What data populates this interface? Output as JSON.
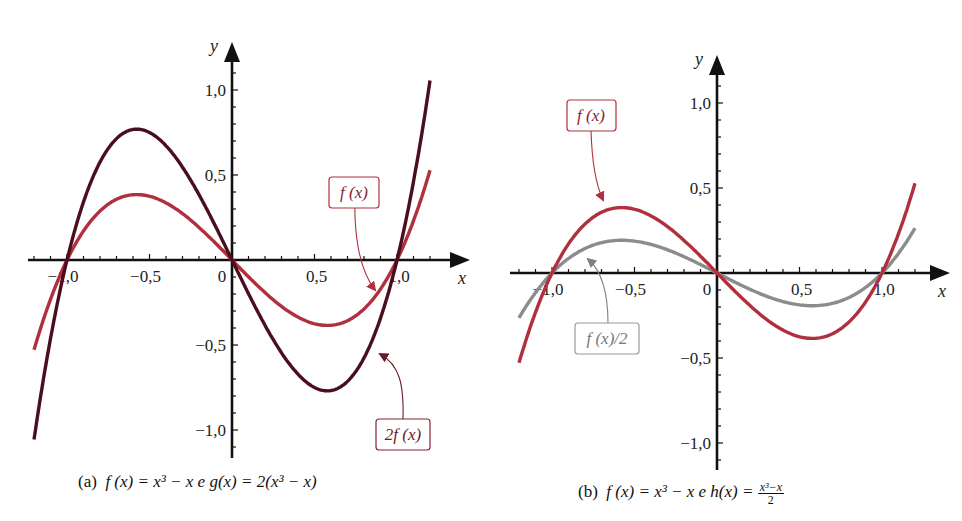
{
  "panels": [
    {
      "id": "a",
      "caption": {
        "prefix": "(a)",
        "text": "f (x) = x³ − x  e  g(x) = 2(x³ − x)"
      },
      "axes": {
        "x_label": "x",
        "y_label": "y",
        "x_ticks": [
          "−1,0",
          "−0,5",
          "0",
          "0,5",
          "1,0"
        ],
        "y_ticks": [
          "1,0",
          "0,5",
          "−0,5",
          "−1,0"
        ]
      },
      "annotations": [
        {
          "label": "f (x)",
          "color": "#b0303f"
        },
        {
          "label": "2f (x)",
          "color": "#6a1a2a"
        }
      ]
    },
    {
      "id": "b",
      "caption": {
        "prefix": "(b)",
        "text": "f (x) = x³ − x  e  h(x) = ",
        "frac_num": "x³−x",
        "frac_den": "2"
      },
      "axes": {
        "x_label": "x",
        "y_label": "y",
        "x_ticks": [
          "−1,0",
          "−0,5",
          "0",
          "0,5",
          "1,0"
        ],
        "y_ticks": [
          "1,0",
          "0,5",
          "−0,5",
          "−1,0"
        ]
      },
      "annotations": [
        {
          "label": "f (x)",
          "color": "#b0303f"
        },
        {
          "label": "f (x)/2",
          "color": "#888888"
        }
      ]
    }
  ],
  "chart_data": [
    {
      "type": "line",
      "title": "(a) f(x) = x^3 − x e g(x) = 2(x^3 − x)",
      "xlabel": "x",
      "ylabel": "y",
      "xlim": [
        -1.2,
        1.2
      ],
      "ylim": [
        -1.1,
        1.1
      ],
      "x_ticks": [
        -1.0,
        -0.5,
        0,
        0.5,
        1.0
      ],
      "y_ticks": [
        -1.0,
        -0.5,
        0.5,
        1.0
      ],
      "grid": false,
      "x": [
        -1.2,
        -1.0,
        -0.8,
        -0.577,
        -0.4,
        -0.2,
        0,
        0.2,
        0.4,
        0.577,
        0.8,
        1.0,
        1.2
      ],
      "series": [
        {
          "name": "f(x)",
          "color": "#b0303f",
          "values": [
            -0.528,
            0,
            0.288,
            0.385,
            0.336,
            0.192,
            0,
            -0.192,
            -0.336,
            -0.385,
            -0.288,
            0,
            0.528
          ]
        },
        {
          "name": "2f(x)",
          "color": "#4a0f1e",
          "values": [
            -1.056,
            0,
            0.576,
            0.77,
            0.672,
            0.384,
            0,
            -0.384,
            -0.672,
            -0.77,
            -0.576,
            0,
            1.056
          ]
        }
      ],
      "annotations": [
        "f(x)",
        "2f(x)"
      ]
    },
    {
      "type": "line",
      "title": "(b) f(x) = x^3 − x e h(x) = (x^3 − x)/2",
      "xlabel": "x",
      "ylabel": "y",
      "xlim": [
        -1.2,
        1.2
      ],
      "ylim": [
        -1.1,
        1.1
      ],
      "x_ticks": [
        -1.0,
        -0.5,
        0,
        0.5,
        1.0
      ],
      "y_ticks": [
        -1.0,
        -0.5,
        0.5,
        1.0
      ],
      "grid": false,
      "x": [
        -1.2,
        -1.0,
        -0.8,
        -0.577,
        -0.4,
        -0.2,
        0,
        0.2,
        0.4,
        0.577,
        0.8,
        1.0,
        1.2
      ],
      "series": [
        {
          "name": "f(x)",
          "color": "#b0303f",
          "values": [
            -0.528,
            0,
            0.288,
            0.385,
            0.336,
            0.192,
            0,
            -0.192,
            -0.336,
            -0.385,
            -0.288,
            0,
            0.528
          ]
        },
        {
          "name": "f(x)/2",
          "color": "#8c8c8c",
          "values": [
            -0.264,
            0,
            0.144,
            0.192,
            0.168,
            0.096,
            0,
            -0.096,
            -0.168,
            -0.192,
            -0.144,
            0,
            0.264
          ]
        }
      ],
      "annotations": [
        "f(x)",
        "f(x)/2"
      ]
    }
  ]
}
